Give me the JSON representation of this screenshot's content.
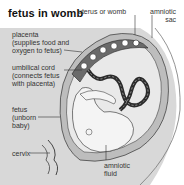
{
  "title": "fetus in womb",
  "labels": {
    "uterus": "uterus or womb",
    "amniotic_sac": "amniotic\nsac",
    "placenta": "placenta\n(supplies food and\noxygen to fetus)",
    "umbilical_cord": "umbilical cord\n(connects fetus\nwith placenta)",
    "fetus": "fetus\n(unborn\nbaby)",
    "cervix": "cervix",
    "amniotic_fluid": "amniotic\nfluid"
  },
  "colors": {
    "background_band": "#d8d8d8",
    "uterus_wall": "#bdbdbd",
    "fluid": "#e9e9e9",
    "fetus": "#f4f4f4",
    "line": "#333333",
    "cord_dark": "#2b2b2b"
  }
}
